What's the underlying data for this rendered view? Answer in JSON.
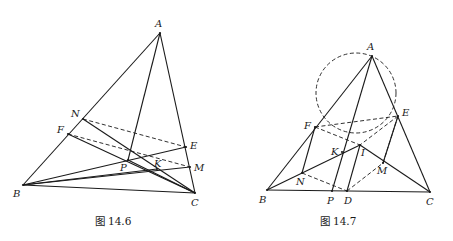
{
  "figures": [
    {
      "caption": "图 14.6",
      "points": {
        "A": {
          "label": "A",
          "x": 160,
          "y": 33
        },
        "B": {
          "label": "B",
          "x": 23,
          "y": 185
        },
        "C": {
          "label": "C",
          "x": 195,
          "y": 193
        },
        "N": {
          "label": "N",
          "x": 83,
          "y": 119
        },
        "F": {
          "label": "F",
          "x": 68,
          "y": 134
        },
        "E": {
          "label": "E",
          "x": 186,
          "y": 147
        },
        "M": {
          "label": "M",
          "x": 190,
          "y": 167
        },
        "P": {
          "label": "P",
          "x": 128,
          "y": 160
        },
        "K": {
          "label": "K",
          "x": 157,
          "y": 169
        }
      },
      "solid_segments": [
        [
          "A",
          "B"
        ],
        [
          "A",
          "C"
        ],
        [
          "B",
          "C"
        ],
        [
          "A",
          "P"
        ],
        [
          "B",
          "E"
        ],
        [
          "B",
          "M"
        ],
        [
          "N",
          "C"
        ],
        [
          "F",
          "C"
        ],
        [
          "P",
          "C"
        ],
        [
          "B",
          "K"
        ]
      ],
      "dashed_segments": [
        [
          "N",
          "E"
        ],
        [
          "F",
          "M"
        ]
      ]
    },
    {
      "caption": "图 14.7",
      "points": {
        "A": {
          "label": "A",
          "x": 372,
          "y": 56
        },
        "B": {
          "label": "B",
          "x": 267,
          "y": 190
        },
        "C": {
          "label": "C",
          "x": 430,
          "y": 192
        },
        "F": {
          "label": "F",
          "x": 315,
          "y": 127
        },
        "E": {
          "label": "E",
          "x": 398,
          "y": 116
        },
        "I": {
          "label": "I",
          "x": 360,
          "y": 145
        },
        "K": {
          "label": "K",
          "x": 342,
          "y": 152
        },
        "M": {
          "label": "M",
          "x": 383,
          "y": 163
        },
        "N": {
          "label": "N",
          "x": 302,
          "y": 173
        },
        "P": {
          "label": "P",
          "x": 332,
          "y": 191
        },
        "D": {
          "label": "D",
          "x": 347,
          "y": 191
        }
      },
      "circle": {
        "cx": 356,
        "cy": 93,
        "r": 40
      },
      "solid_segments": [
        [
          "A",
          "B"
        ],
        [
          "A",
          "C"
        ],
        [
          "B",
          "C"
        ],
        [
          "A",
          "P"
        ],
        [
          "B",
          "I"
        ],
        [
          "I",
          "C"
        ],
        [
          "F",
          "N"
        ],
        [
          "E",
          "M"
        ],
        [
          "I",
          "D"
        ]
      ],
      "dashed_segments": [
        [
          "F",
          "I"
        ],
        [
          "E",
          "I"
        ],
        [
          "F",
          "E"
        ],
        [
          "N",
          "D"
        ],
        [
          "D",
          "M"
        ],
        [
          "M",
          "E"
        ]
      ]
    }
  ]
}
